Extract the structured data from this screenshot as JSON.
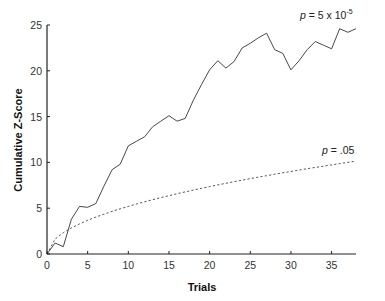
{
  "chart_data": {
    "type": "line",
    "title": "",
    "xlabel": "Trials",
    "ylabel": "Cumulative Z-Score",
    "xlim": [
      0,
      38
    ],
    "ylim": [
      0,
      25
    ],
    "xticks": [
      0,
      5,
      10,
      15,
      20,
      25,
      30,
      35
    ],
    "yticks": [
      0,
      5,
      10,
      15,
      20,
      25
    ],
    "grid": false,
    "legend": null,
    "x": [
      0,
      1,
      2,
      3,
      4,
      5,
      6,
      7,
      8,
      9,
      10,
      11,
      12,
      13,
      14,
      15,
      16,
      17,
      18,
      19,
      20,
      21,
      22,
      23,
      24,
      25,
      26,
      27,
      28,
      29,
      30,
      31,
      32,
      33,
      34,
      35,
      36,
      37,
      38
    ],
    "series": [
      {
        "name": "Cumulative Z-Score",
        "style": "solid",
        "color": "#333333",
        "values": [
          0,
          1.2,
          0.8,
          3.8,
          5.2,
          5.1,
          5.5,
          7.4,
          9.2,
          9.8,
          11.8,
          12.3,
          12.8,
          13.9,
          14.5,
          15.1,
          14.5,
          14.8,
          16.8,
          18.5,
          20.1,
          21.1,
          20.3,
          21.0,
          22.5,
          23.0,
          23.6,
          24.1,
          22.3,
          21.9,
          20.1,
          21.1,
          22.3,
          23.2,
          22.8,
          22.4,
          24.6,
          24.2,
          24.6
        ]
      },
      {
        "name": "p = .05 threshold",
        "style": "dashed",
        "color": "#555555",
        "values": [
          0,
          1.64,
          2.33,
          2.85,
          3.29,
          3.68,
          4.03,
          4.35,
          4.65,
          4.93,
          5.2,
          5.46,
          5.7,
          5.93,
          6.16,
          6.37,
          6.58,
          6.78,
          6.98,
          7.17,
          7.36,
          7.54,
          7.72,
          7.89,
          8.06,
          8.23,
          8.39,
          8.55,
          8.7,
          8.86,
          9.01,
          9.16,
          9.31,
          9.45,
          9.59,
          9.73,
          9.87,
          10.01,
          10.14
        ]
      }
    ],
    "annotations": [
      {
        "text": "p = 5 x 10",
        "superscript": "-5",
        "x": 36,
        "y": 25.5,
        "target_series": "Cumulative Z-Score"
      },
      {
        "text": "p = .05",
        "x": 36,
        "y": 11.5,
        "target_series": "p = .05 threshold"
      }
    ]
  },
  "labels": {
    "xlabel": "Trials",
    "ylabel": "Cumulative Z-Score",
    "annot_high_p": "p",
    "annot_high_rest": " = 5 x 10",
    "annot_high_sup": "-5",
    "annot_low_p": "p",
    "annot_low_rest": " = .05"
  }
}
